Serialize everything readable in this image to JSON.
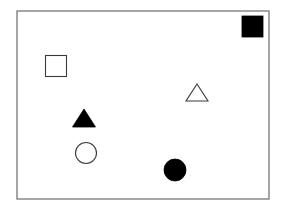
{
  "diagram": {
    "frame": {
      "x": 17,
      "y": 11,
      "width": 252,
      "height": 188,
      "stroke": "#6b6b6b"
    },
    "colors": {
      "fill_dark": "#000000",
      "stroke": "#3a3a3a",
      "fill_light": "#ffffff"
    },
    "shapes": [
      {
        "id": "filled-square",
        "type": "square",
        "filled": true,
        "x": 242,
        "y": 16,
        "size": 21
      },
      {
        "id": "hollow-square",
        "type": "square",
        "filled": false,
        "x": 45.5,
        "y": 55.5,
        "size": 21
      },
      {
        "id": "hollow-triangle",
        "type": "triangle",
        "filled": false,
        "cx": 197,
        "top": 84,
        "bottom": 101,
        "half_width": 11
      },
      {
        "id": "filled-triangle",
        "type": "triangle",
        "filled": true,
        "cx": 84,
        "top": 109,
        "bottom": 127,
        "half_width": 11.5
      },
      {
        "id": "hollow-circle",
        "type": "circle",
        "filled": false,
        "cx": 86,
        "cy": 153,
        "r": 10.5
      },
      {
        "id": "filled-circle",
        "type": "circle",
        "filled": true,
        "cx": 175,
        "cy": 170,
        "r": 11
      }
    ]
  }
}
